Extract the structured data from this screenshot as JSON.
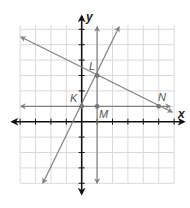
{
  "diagram": {
    "type": "coordinate-plane",
    "axes": {
      "x_label": "x",
      "y_label": "y",
      "x_range": [
        -4,
        6
      ],
      "y_range": [
        -4,
        6
      ],
      "grid": true
    },
    "points": [
      {
        "name": "K",
        "x": 0,
        "y": 1
      },
      {
        "name": "L",
        "x": 1,
        "y": 3
      },
      {
        "name": "M",
        "x": 1,
        "y": 1
      },
      {
        "name": "N",
        "x": 5,
        "y": 1
      }
    ],
    "lines": [
      {
        "name": "line-KL",
        "through": [
          "K",
          "L"
        ],
        "slope": 2,
        "intercept": 1
      },
      {
        "name": "line-LN",
        "through": [
          "L",
          "N"
        ],
        "slope": -0.5,
        "intercept": 3.5
      },
      {
        "name": "line-LM",
        "through": [
          "L",
          "M"
        ],
        "vertical_x": 1
      },
      {
        "name": "line-KMN",
        "through": [
          "K",
          "M",
          "N"
        ],
        "horizontal_y": 1
      }
    ],
    "colors": {
      "grid": "#d9d9d9",
      "axes": "#111111",
      "lines": "#808080",
      "points": "#777777"
    }
  }
}
